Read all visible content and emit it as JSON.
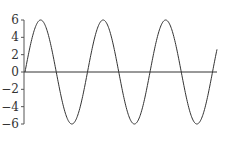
{
  "chart_data": {
    "type": "line",
    "title": "",
    "xlabel": "",
    "ylabel": "",
    "function": "y = 6 sin(x)",
    "amplitude": 6,
    "cycles": 3.07,
    "x_range": [
      0,
      19.3
    ],
    "ylim": [
      -6,
      6
    ],
    "yticks": [
      6,
      4,
      2,
      0,
      -2,
      -4,
      -6
    ],
    "ytick_labels": [
      "6",
      "4",
      "2",
      "0",
      "−2",
      "−4",
      "−6"
    ],
    "xticks": [],
    "grid": false,
    "legend": null,
    "zero_line": true,
    "series": [
      {
        "name": "sine",
        "color": "#333333",
        "description": "sine wave, amplitude 6, starts at 0 rising, ~3 full periods, ends near +3"
      }
    ]
  },
  "layout": {
    "plot_left_px": 24,
    "plot_right_px": 217,
    "y_top_px": 20,
    "y_bottom_px": 124,
    "line_color": "#333333",
    "axis_color": "#555555"
  }
}
